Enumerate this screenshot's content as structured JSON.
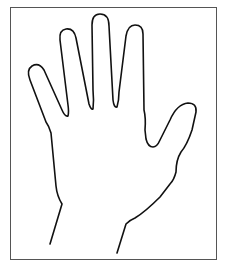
{
  "figure": {
    "subject": "outline of an open right hand, palm facing, fingers spread",
    "frame_color": "#555555",
    "stroke_color": "#111111",
    "background": "#ffffff"
  }
}
